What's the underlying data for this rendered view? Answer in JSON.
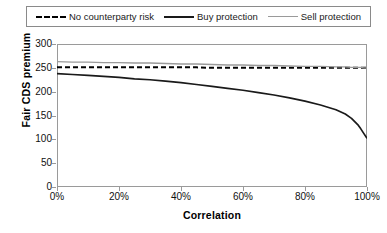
{
  "chart_data": {
    "type": "line",
    "title": "",
    "xlabel": "Correlation",
    "ylabel": "Fair CDS premium",
    "xlim": [
      0,
      100
    ],
    "ylim": [
      0,
      300
    ],
    "xtick_labels": [
      "0%",
      "20%",
      "40%",
      "60%",
      "80%",
      "100%"
    ],
    "xtick_values": [
      0,
      20,
      40,
      60,
      80,
      100
    ],
    "ytick_labels": [
      "0",
      "50",
      "100",
      "150",
      "200",
      "250",
      "300"
    ],
    "ytick_values": [
      0,
      50,
      100,
      150,
      200,
      250,
      300
    ],
    "grid": false,
    "legend_position": "top",
    "x": [
      0,
      5,
      10,
      15,
      20,
      25,
      30,
      35,
      40,
      45,
      50,
      55,
      60,
      65,
      70,
      75,
      80,
      85,
      90,
      93,
      95,
      97,
      98,
      99,
      100
    ],
    "series": [
      {
        "name": "No counterparty risk",
        "style": "dashed",
        "color": "#000000",
        "values": [
          251,
          251,
          251,
          251,
          251,
          251,
          251,
          251,
          251,
          251,
          250,
          250,
          250,
          250,
          250,
          250,
          250,
          250,
          250,
          250,
          250,
          250,
          250,
          250,
          250
        ]
      },
      {
        "name": "Buy protection",
        "style": "solid-thick",
        "color": "#1a1a1a",
        "values": [
          238,
          236,
          234,
          232,
          230,
          227,
          225,
          222,
          219,
          215,
          211,
          207,
          203,
          198,
          193,
          187,
          180,
          172,
          162,
          153,
          144,
          131,
          122,
          112,
          102
        ]
      },
      {
        "name": "Sell protection",
        "style": "solid-thin",
        "color": "#9a9a9a",
        "values": [
          263,
          262,
          262,
          261,
          261,
          260,
          260,
          259,
          258,
          258,
          257,
          256,
          256,
          255,
          255,
          254,
          253,
          253,
          252,
          252,
          251,
          251,
          251,
          250,
          250
        ]
      }
    ]
  },
  "legend": {
    "entries": [
      {
        "label": "No counterparty risk",
        "swatch": "dashed-line-swatch"
      },
      {
        "label": "Buy protection",
        "swatch": "thick-solid-line-swatch"
      },
      {
        "label": "Sell protection",
        "swatch": "thin-solid-line-swatch"
      }
    ]
  }
}
